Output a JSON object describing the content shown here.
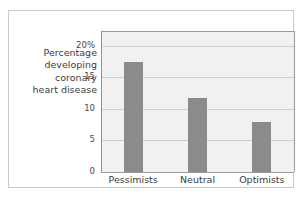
{
  "chart_data": {
    "type": "bar",
    "title": "",
    "xlabel": "",
    "ylabel": "Percentage developing coronary heart disease",
    "ylabel_lines": [
      "Percentage",
      "developing",
      "coronary",
      "heart disease"
    ],
    "categories": [
      "Pessimists",
      "Neutral",
      "Optimists"
    ],
    "values": [
      17.4,
      11.8,
      8.0
    ],
    "series": [
      {
        "name": "Percentage developing coronary heart disease",
        "values": [
          17.4,
          11.8,
          8.0
        ]
      }
    ],
    "ylim": [
      0,
      22.2
    ],
    "y_ticks": [
      0,
      5,
      10,
      15,
      20
    ],
    "y_tick_labels": [
      "0",
      "5",
      "10",
      "15",
      "20%"
    ],
    "grid": true,
    "legend": "none",
    "bar_color": "#8b8b8b",
    "plot_background": "#f1f1f1",
    "gridline_color": "#cfcfcf",
    "axis_color": "#9a9a9a",
    "frame_color": "#c9c9c9"
  }
}
